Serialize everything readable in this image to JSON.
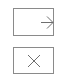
{
  "controls": [
    {
      "name": "enter-button",
      "icon": "arrow-right-icon"
    },
    {
      "name": "close-button",
      "icon": "close-icon"
    }
  ],
  "colors": {
    "stroke": "#8a8a8a",
    "background": "#ffffff"
  }
}
